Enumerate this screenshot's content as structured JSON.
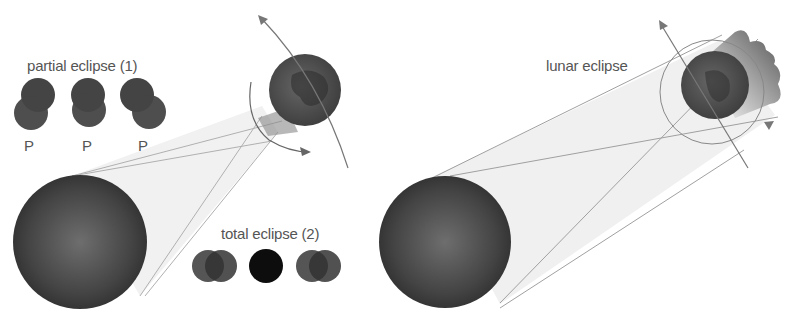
{
  "labels": {
    "partial_eclipse": "partial eclipse (1)",
    "total_eclipse": "total eclipse (2)",
    "lunar_eclipse": "lunar eclipse",
    "phase_markers": [
      "P",
      "P",
      "P"
    ]
  },
  "panels": [
    {
      "name": "solar-eclipse",
      "bodies": [
        "sun",
        "moon",
        "earth"
      ]
    },
    {
      "name": "lunar-eclipse",
      "bodies": [
        "sun",
        "earth",
        "moon"
      ]
    }
  ],
  "colors": {
    "body_dark": "#3a3a3a",
    "body_highlight": "#6a6a6a",
    "earth": "#5a5a5a",
    "shadow_cone": "#eeeeee",
    "line": "#9a9a9a",
    "text": "#555555"
  }
}
